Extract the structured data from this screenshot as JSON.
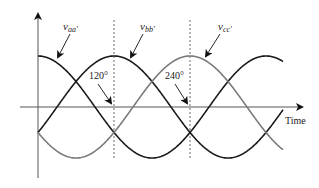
{
  "diagram": {
    "axis": {
      "x_label": "Time",
      "color": "#555555"
    },
    "waveforms": [
      {
        "name": "v_aa'",
        "label_main": "v",
        "label_sub": "aa'",
        "phase_deg": 0,
        "color": "#1a1a1a"
      },
      {
        "name": "v_bb'",
        "label_main": "v",
        "label_sub": "bb'",
        "phase_deg": 120,
        "color": "#1a1a1a"
      },
      {
        "name": "v_cc'",
        "label_main": "v",
        "label_sub": "cc'",
        "phase_deg": 240,
        "color": "#7a7a7a"
      }
    ],
    "annotations": [
      {
        "text": "120°",
        "at_deg": 120
      },
      {
        "text": "240°",
        "at_deg": 240
      }
    ],
    "dashed_lines_deg": [
      120,
      240
    ]
  }
}
